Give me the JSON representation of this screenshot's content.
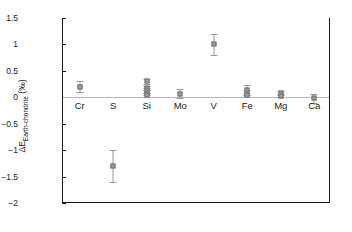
{
  "chart_data": {
    "type": "scatter",
    "title": "",
    "xlabel": "",
    "ylabel": "ΔE Earth-chondrite (‰)",
    "ylabel_main": "ΔE",
    "ylabel_sub": "Earth-chondrite",
    "ylabel_unit": "(‰)",
    "ylim": [
      -2,
      1.5
    ],
    "yticks": [
      1.5,
      1,
      0.5,
      0,
      -0.5,
      -1,
      -1.5,
      -2
    ],
    "ytick_labels": [
      "1.5",
      "1",
      "0.5",
      "0",
      "−0.5",
      "−1",
      "−1.5",
      "−2"
    ],
    "grid": false,
    "legend": "none",
    "zero_line": true,
    "categories": [
      "Cr",
      "S",
      "Si",
      "Mo",
      "V",
      "Fe",
      "Mg",
      "Ca"
    ],
    "series": [
      {
        "name": "Cr",
        "points": [
          {
            "value": 0.2,
            "err_low": 0.1,
            "err_high": 0.1
          }
        ]
      },
      {
        "name": "S",
        "points": [
          {
            "value": -1.3,
            "err_low": 0.3,
            "err_high": 0.3
          }
        ]
      },
      {
        "name": "Si",
        "points": [
          {
            "value": 0.3,
            "err_low": 0.05,
            "err_high": 0.05
          },
          {
            "value": 0.17,
            "err_low": 0.04,
            "err_high": 0.04
          },
          {
            "value": 0.13,
            "err_low": 0.04,
            "err_high": 0.04
          },
          {
            "value": 0.09,
            "err_low": 0.04,
            "err_high": 0.04
          },
          {
            "value": 0.04,
            "err_low": 0.04,
            "err_high": 0.04
          }
        ]
      },
      {
        "name": "Mo",
        "points": [
          {
            "value": 0.07,
            "err_low": 0.09,
            "err_high": 0.09
          }
        ]
      },
      {
        "name": "V",
        "points": [
          {
            "value": 1.0,
            "err_low": 0.2,
            "err_high": 0.2
          }
        ]
      },
      {
        "name": "Fe",
        "points": [
          {
            "value": 0.14,
            "err_low": 0.09,
            "err_high": 0.09
          },
          {
            "value": 0.09,
            "err_low": 0.05,
            "err_high": 0.05
          },
          {
            "value": 0.04,
            "err_low": 0.04,
            "err_high": 0.04
          }
        ]
      },
      {
        "name": "Mg",
        "points": [
          {
            "value": 0.08,
            "err_low": 0.04,
            "err_high": 0.04
          },
          {
            "value": 0.03,
            "err_low": 0.03,
            "err_high": 0.03
          }
        ]
      },
      {
        "name": "Ca",
        "points": [
          {
            "value": -0.02,
            "err_low": 0.08,
            "err_high": 0.08
          }
        ]
      }
    ],
    "colors": {
      "marker_fill": "#9d9d9d",
      "marker_edge": "#6f6f6f",
      "error_bar": "#9a9a9a",
      "axis": "#1a1a1a",
      "zero_line": "#b9b9b9",
      "background": "#ffffff"
    }
  }
}
